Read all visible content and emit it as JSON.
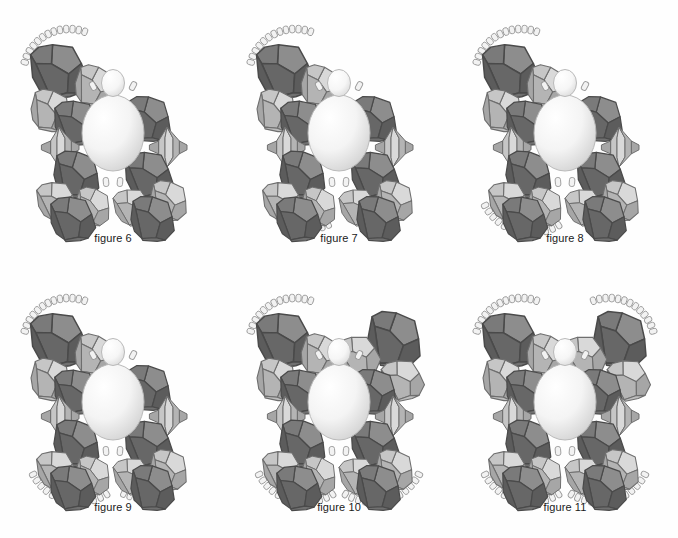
{
  "document": {
    "kind": "scientific-assembly-diagram",
    "background_color": "#fefefe",
    "caption_color": "#1a1a1a"
  },
  "palette": {
    "dark_face_light": "#8d8d8d",
    "dark_face_mid": "#7a7a7a",
    "dark_face_dark": "#676767",
    "dark_face_darkest": "#5c5c5c",
    "light_face_light": "#d9d9d9",
    "light_face_mid": "#c6c6c6",
    "light_face_dark": "#b4b4b4",
    "light_face_darkest": "#a6a6a6",
    "edge_stroke": "#4a4a4a",
    "light_edge_stroke": "#6e6e6e",
    "sphere_high": "#ffffff",
    "sphere_low": "#d2d2d2",
    "sphere_stroke": "#b9b9b9",
    "capsule_fill": "#f2f2f2",
    "capsule_stroke": "#9a9a9a"
  },
  "legend": {
    "dark_unit_name": "dark-polyhedron",
    "light_unit_name": "light-polyhedron",
    "bicone_unit_name": "light-bicone",
    "core_name": "central-sphere",
    "head_name": "small-sphere",
    "chain_name": "capsule-arc",
    "linker_name": "capsule-linker"
  },
  "panels": [
    {
      "id": "figure-6",
      "caption": "figure 6",
      "row": 0,
      "col": 0,
      "arcs": [
        "upper-left"
      ],
      "description": "core with one upper-left arc"
    },
    {
      "id": "figure-7",
      "caption": "figure 7",
      "row": 0,
      "col": 1,
      "arcs": [
        "upper-left",
        "lower-left"
      ],
      "description": "core with upper-left and lower-left arcs"
    },
    {
      "id": "figure-8",
      "caption": "figure 8",
      "row": 0,
      "col": 2,
      "arcs": [
        "upper-left",
        "lower-left-wide"
      ],
      "description": "core with upper-left arc and lower spread"
    },
    {
      "id": "figure-9",
      "caption": "figure 9",
      "row": 1,
      "col": 0,
      "arcs": [
        "upper-left",
        "lower-left-wide",
        "lower-right"
      ],
      "description": "core with three arcs"
    },
    {
      "id": "figure-10",
      "caption": "figure 10",
      "row": 1,
      "col": 1,
      "arcs": [
        "upper-left",
        "lower-left-wide",
        "lower-right-wide",
        "upper-right-units"
      ],
      "description": "symmetric with both lower arcs and right wing"
    },
    {
      "id": "figure-11",
      "caption": "figure 11",
      "row": 1,
      "col": 2,
      "arcs": [
        "upper-left",
        "upper-right",
        "lower-left-wide",
        "lower-right-wide"
      ],
      "description": "fully symmetric, four arcs"
    }
  ]
}
